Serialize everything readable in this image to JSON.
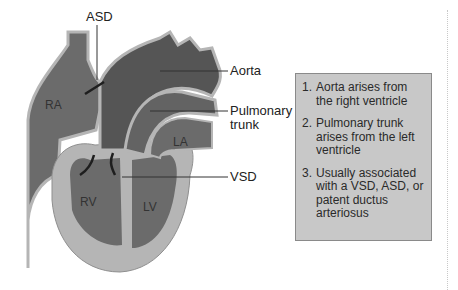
{
  "diagram": {
    "colors": {
      "chamber_fill": "#6b6b6b",
      "great_vessel_fill": "#5a5a5a",
      "wall_fill": "#b5b5b5",
      "outline": "#3a3a3a",
      "info_box_bg": "#c8c8c8",
      "info_box_border": "#8a8a8a",
      "text": "#222222"
    },
    "callouts": {
      "asd": "ASD",
      "aorta": "Aorta",
      "pulmonary_line1": "Pulmonary",
      "pulmonary_line2": "trunk",
      "vsd": "VSD"
    },
    "chambers": {
      "ra": "RA",
      "la": "LA",
      "rv": "RV",
      "lv": "LV"
    },
    "info_box": {
      "items": [
        {
          "num": "1.",
          "text": "Aorta arises from the right ventricle"
        },
        {
          "num": "2.",
          "text": "Pulmonary trunk arises from the left ventricle"
        },
        {
          "num": "3.",
          "text": "Usually associated with a VSD, ASD, or patent ductus arteriosus"
        }
      ]
    }
  }
}
